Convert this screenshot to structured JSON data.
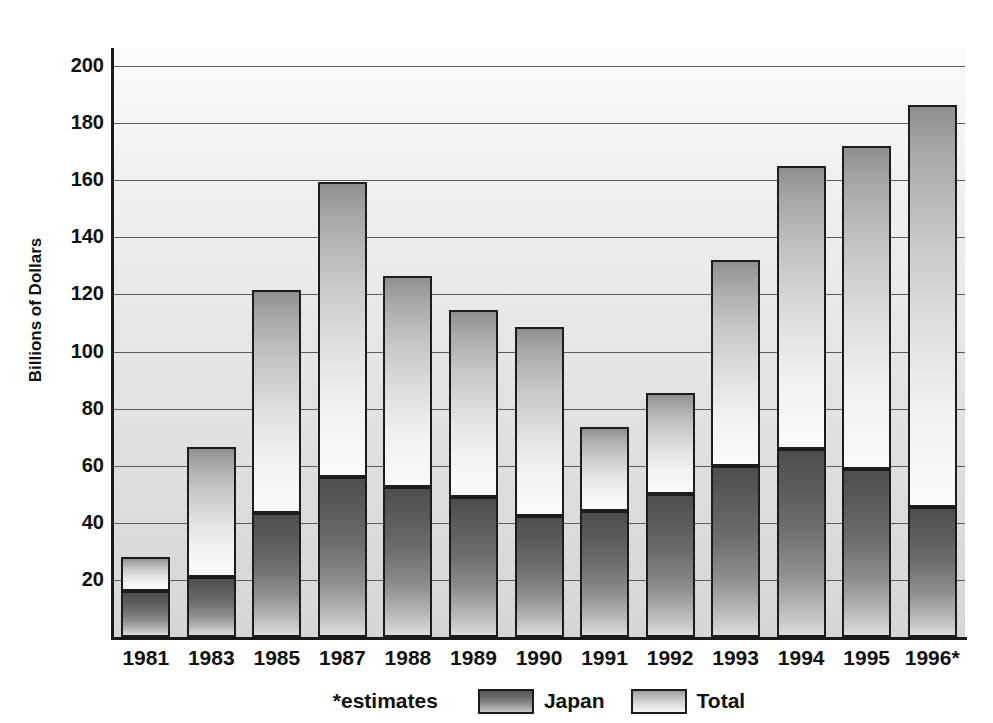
{
  "chart_data": {
    "type": "bar",
    "subtype": "stacked-vertical",
    "title": "",
    "xlabel": "",
    "ylabel": "Billions of Dollars",
    "ylim": [
      0,
      200
    ],
    "ytick_step": 20,
    "yticks": [
      200,
      180,
      160,
      140,
      120,
      100,
      80,
      60,
      40,
      20
    ],
    "grid": true,
    "legend_position": "bottom",
    "categories": [
      "1981",
      "1983",
      "1985",
      "1987",
      "1988",
      "1989",
      "1990",
      "1991",
      "1992",
      "1993",
      "1994",
      "1995",
      "1996*"
    ],
    "series": [
      {
        "name": "Japan",
        "values": [
          16,
          21,
          43.5,
          56,
          52.5,
          49,
          42.5,
          44,
          50,
          60,
          66,
          59,
          45.5
        ]
      },
      {
        "name": "Total",
        "values": [
          28,
          66.5,
          121.5,
          159.5,
          126.5,
          114.5,
          108.5,
          73.5,
          85.5,
          132,
          165,
          172,
          186.5
        ]
      }
    ],
    "notes": "*estimates",
    "stacking_note": "Japan is the lower (dark) portion of each bar; Total is the full bar height, with the upper (light) portion representing the remainder above Japan."
  },
  "legend": {
    "note": "*estimates",
    "items": [
      {
        "label": "Japan",
        "swatch": "japan-gradient-swatch"
      },
      {
        "label": "Total",
        "swatch": "total-gradient-swatch"
      }
    ]
  },
  "axes": {
    "y_title": "Billions of Dollars"
  },
  "colors": {
    "plot_background": "#e4e4e4",
    "gridline": "#5b5b5b",
    "axis_line": "#1a1a1a",
    "bar_border": "#1c1c1c",
    "japan_dark": "#4e4e4e",
    "total_light": "#f2f2f2",
    "text": "#111111"
  }
}
